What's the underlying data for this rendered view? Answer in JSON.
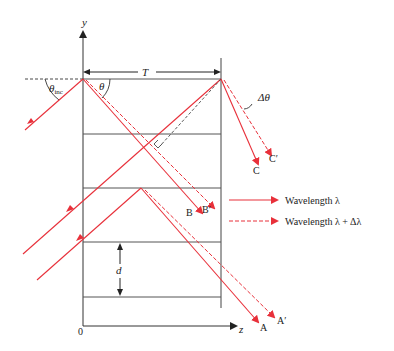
{
  "labels": {
    "y_axis": "y",
    "z_axis": "z",
    "origin": "0",
    "period": "T",
    "spacing": "d",
    "theta_inc": "θ",
    "theta_inc_sub": "inc",
    "theta": "θ",
    "delta_theta": "Δθ",
    "A": "A",
    "A_prime": "A′",
    "B": "B",
    "B_prime": "B′",
    "C": "C",
    "C_prime": "C′"
  },
  "legend": [
    {
      "style": "solid",
      "label": "Wavelength λ"
    },
    {
      "style": "dashed",
      "label": "Wavelength λ + Δλ"
    }
  ],
  "colors": {
    "ray": "#e8303a",
    "axis": "#333333",
    "grid": "#555555"
  }
}
